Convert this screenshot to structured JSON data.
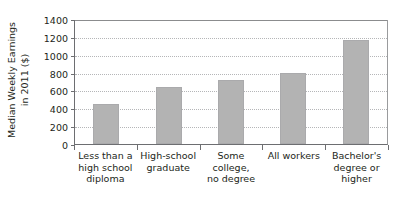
{
  "chart_data": {
    "type": "bar",
    "title": "",
    "xlabel": "",
    "ylabel_line1": "Median Weekly Earnings",
    "ylabel_line2": "in 2011 ($)",
    "categories": [
      "Less than a high school diploma",
      "High-school graduate",
      "Some college, no degree",
      "All workers",
      "Bachelor's degree or higher"
    ],
    "category_lines": [
      [
        "Less than a",
        "high school",
        "diploma"
      ],
      [
        "High-school",
        "graduate"
      ],
      [
        "Some college,",
        "no degree"
      ],
      [
        "All workers"
      ],
      [
        "Bachelor's",
        "degree or",
        "higher"
      ]
    ],
    "values": [
      451,
      638,
      719,
      797,
      1163
    ],
    "ylim": [
      0,
      1400
    ],
    "yticks": [
      0,
      200,
      400,
      600,
      800,
      1000,
      1200,
      1400
    ],
    "ytick_labels": [
      "0",
      "200",
      "400",
      "600",
      "800",
      "1000",
      "1200",
      "1400"
    ],
    "grid": true,
    "legend": "none",
    "bar_color": "#b3b3b3",
    "axis_color": "#6d6e71",
    "grid_color": "#b5b6b8",
    "text_color": "#231f20",
    "background": "#ffffff"
  }
}
